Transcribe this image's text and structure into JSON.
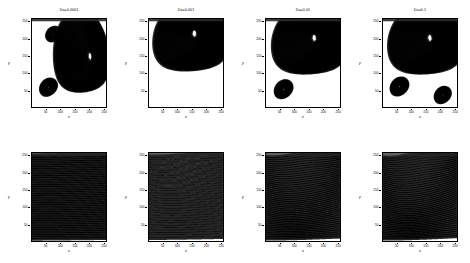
{
  "figure": {
    "rows": 2,
    "cols": 4,
    "background": "#ffffff",
    "line_color": "#000000"
  },
  "axes": {
    "xlabel": "x",
    "ylabel": "y",
    "xticks": [
      "50",
      "100",
      "150",
      "200",
      "250"
    ],
    "yticks": [
      "50",
      "100",
      "150",
      "200",
      "250"
    ],
    "xlim": [
      0,
      260
    ],
    "ylim": [
      0,
      260
    ]
  },
  "panels": [
    {
      "id": "streamlines-da-0.0001",
      "title": "Da=0.0001",
      "row": "streamlines",
      "da": "0.0001"
    },
    {
      "id": "streamlines-da-0.001",
      "title": "Da=0.001",
      "row": "streamlines",
      "da": "0.001"
    },
    {
      "id": "streamlines-da-0.01",
      "title": "Da=0.01",
      "row": "streamlines",
      "da": "0.01"
    },
    {
      "id": "streamlines-da-0.1",
      "title": "Da=0.1",
      "row": "streamlines",
      "da": "0.1"
    },
    {
      "id": "isotherms-da-0.0001",
      "title": "",
      "row": "isotherms",
      "da": "0.0001"
    },
    {
      "id": "isotherms-da-0.001",
      "title": "",
      "row": "isotherms",
      "da": "0.001"
    },
    {
      "id": "isotherms-da-0.01",
      "title": "",
      "row": "isotherms",
      "da": "0.01"
    },
    {
      "id": "isotherms-da-0.1",
      "title": "",
      "row": "isotherms",
      "da": "0.1"
    }
  ],
  "chart_data": {
    "type": "line",
    "title": "",
    "xlabel": "x",
    "ylabel": "y",
    "xlim": [
      0,
      260
    ],
    "ylim": [
      0,
      260
    ],
    "xticks": [
      50,
      100,
      150,
      200,
      250
    ],
    "yticks": [
      50,
      100,
      150,
      200,
      250
    ],
    "grid": false,
    "legend": "none",
    "panels": [
      {
        "title": "Da=0.0001",
        "kind": "streamlines",
        "n_contours": 30,
        "primary_vortex": {
          "center_x": 205,
          "center_y": 150,
          "strength": 1.0,
          "shape": "tall-narrow"
        },
        "secondary_vortices": [
          {
            "center_x": 58,
            "center_y": 58,
            "strength": 0.35,
            "shape": "oval"
          },
          {
            "center_x": 75,
            "center_y": 215,
            "strength": 0.2,
            "shape": "oval"
          }
        ],
        "notes": "Strong vertical shear layer near x=160; weak penetration of lid-driven flow"
      },
      {
        "title": "Da=0.001",
        "kind": "streamlines",
        "n_contours": 30,
        "primary_vortex": {
          "center_x": 160,
          "center_y": 218,
          "strength": 1.0,
          "shape": "wide-oval"
        },
        "secondary_vortices": [],
        "notes": "Single large cell pushed toward upper region, nested ellipses fill cavity"
      },
      {
        "title": "Da=0.01",
        "kind": "streamlines",
        "n_contours": 30,
        "primary_vortex": {
          "center_x": 170,
          "center_y": 205,
          "strength": 1.0,
          "shape": "oval"
        },
        "secondary_vortices": [
          {
            "center_x": 62,
            "center_y": 52,
            "strength": 0.4,
            "shape": "oval"
          }
        ],
        "notes": "Corner eddy at lower left separated by a diagonal dividing streamline"
      },
      {
        "title": "Da=0.1",
        "kind": "streamlines",
        "n_contours": 30,
        "primary_vortex": {
          "center_x": 165,
          "center_y": 205,
          "strength": 1.0,
          "shape": "oval"
        },
        "secondary_vortices": [
          {
            "center_x": 58,
            "center_y": 60,
            "strength": 0.4,
            "shape": "oval"
          },
          {
            "center_x": 210,
            "center_y": 35,
            "strength": 0.3,
            "shape": "small-oval"
          }
        ],
        "notes": "Two corner eddies, lower left and lower right, strong diagonal separation"
      },
      {
        "title": "",
        "kind": "isotherms",
        "n_contours": 48,
        "pattern": "near-horizontal stratified lines, slight upward tilt toward right",
        "distortion": 0.05,
        "notes": "Conduction dominated, isotherms almost parallel to horizontal walls"
      },
      {
        "title": "",
        "kind": "isotherms",
        "n_contours": 34,
        "pattern": "horizontal lines with mild S-shaped waviness in the upper right",
        "distortion": 0.18,
        "notes": "Onset of convective distortion near the moving lid"
      },
      {
        "title": "",
        "kind": "isotherms",
        "n_contours": 44,
        "pattern": "strongly wavy, plume rising left of center, compressed near upper right corner",
        "distortion": 0.55,
        "notes": "Convection dominated, steep thermal gradients along top wall"
      },
      {
        "title": "",
        "kind": "isotherms",
        "n_contours": 44,
        "pattern": "strongly wavy with tight bundling at upper right and a broad warm core",
        "distortion": 0.7,
        "notes": "Most vigorous convection, thinnest thermal boundary layer at the lid"
      }
    ]
  }
}
